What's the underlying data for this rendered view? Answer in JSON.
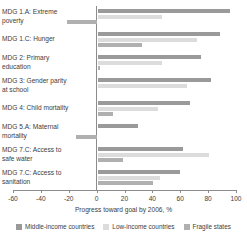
{
  "chart_data": {
    "type": "bar",
    "orientation": "horizontal",
    "title": "",
    "xlabel": "Progress toward goal by 2006, %",
    "ylabel": "",
    "xlim": [
      -60,
      100
    ],
    "xticks": [
      -60,
      -40,
      -20,
      0,
      20,
      40,
      60,
      80,
      100
    ],
    "xtick_labels": [
      "-60",
      "-40",
      "-20",
      "0",
      "20",
      "40",
      "60",
      "80",
      "100"
    ],
    "grid": false,
    "legend_position": "bottom",
    "categories": [
      "MDG 1.A: Extreme poverty",
      "MDG 1.C: Hunger",
      "MDG 2: Primary education",
      "MDG 3: Gender parity at school",
      "MDG 4: Child mortality",
      "MDG 5.A: Maternal mortality",
      "MDG 7.C: Access to safe water",
      "MDG 7.C: Access to sanitation"
    ],
    "category_lines": [
      [
        "MDG 1.A: Extreme",
        "poverty"
      ],
      [
        "MDG 1.C: Hunger"
      ],
      [
        "MDG 2: Primary",
        "education"
      ],
      [
        "MDG 3: Gender parity",
        "at school"
      ],
      [
        "MDG 4: Child mortality"
      ],
      [
        "MDG 5.A: Maternal",
        "mortality"
      ],
      [
        "MDG 7.C: Access to",
        "safe water"
      ],
      [
        "MDG 7.C: Access to",
        "sanitation"
      ]
    ],
    "series": [
      {
        "name": "Middle-income countries",
        "color": "#9a9a9a",
        "values": [
          95,
          88,
          74,
          81,
          66,
          29,
          61,
          59
        ]
      },
      {
        "name": "Low-income countries",
        "color": "#dcdcdc",
        "values": [
          46,
          71,
          46,
          64,
          43,
          0,
          80,
          45
        ]
      },
      {
        "name": "Fragile states",
        "color": "#b0b0b0",
        "values": [
          -21,
          32,
          2,
          0,
          11,
          -15,
          18,
          40
        ]
      }
    ]
  },
  "legend": {
    "items": [
      {
        "label": "Middle-income countries",
        "swatch": "mid"
      },
      {
        "label": "Low-income countries",
        "swatch": "low"
      },
      {
        "label": "Fragile states",
        "swatch": "frag"
      }
    ]
  }
}
